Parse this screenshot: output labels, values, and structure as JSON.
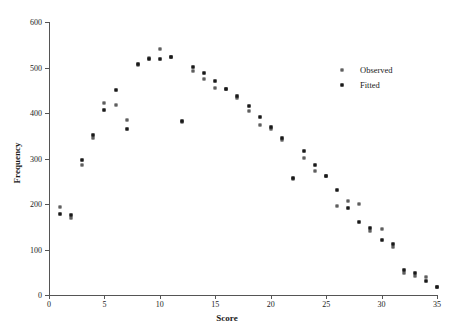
{
  "chart_data": {
    "type": "scatter",
    "title": "",
    "xlabel": "Score",
    "ylabel": "Frequency",
    "xlim": [
      0,
      35
    ],
    "ylim": [
      0,
      600
    ],
    "xticks": [
      0,
      5,
      10,
      15,
      20,
      25,
      30,
      35
    ],
    "yticks": [
      0,
      100,
      200,
      300,
      400,
      500,
      600
    ],
    "grid": false,
    "legend_position": "upper right",
    "x": [
      1,
      2,
      3,
      4,
      5,
      6,
      7,
      8,
      9,
      10,
      11,
      12,
      13,
      14,
      15,
      16,
      17,
      18,
      19,
      20,
      21,
      22,
      23,
      24,
      25,
      26,
      27,
      28,
      29,
      30,
      31,
      32,
      33,
      34,
      35
    ],
    "series": [
      {
        "name": "Observed",
        "marker": "open-square",
        "values": [
          193,
          170,
          285,
          345,
          422,
          417,
          384,
          505,
          520,
          540,
          523,
          380,
          493,
          475,
          455,
          452,
          432,
          405,
          374,
          365,
          340,
          255,
          302,
          272,
          262,
          195,
          207,
          200,
          140,
          145,
          105,
          48,
          42,
          40,
          18
        ]
      },
      {
        "name": "Fitted",
        "marker": "filled-square",
        "values": [
          178,
          176,
          296,
          352,
          407,
          450,
          365,
          507,
          519,
          519,
          522,
          382,
          502,
          489,
          471,
          452,
          437,
          415,
          392,
          370,
          345,
          258,
          316,
          285,
          262,
          230,
          192,
          160,
          148,
          120,
          112,
          55,
          48,
          30,
          18
        ]
      }
    ]
  },
  "legend": {
    "items": [
      {
        "label": "Observed",
        "marker": "open-square"
      },
      {
        "label": "Fitted",
        "marker": "filled-square"
      }
    ]
  }
}
